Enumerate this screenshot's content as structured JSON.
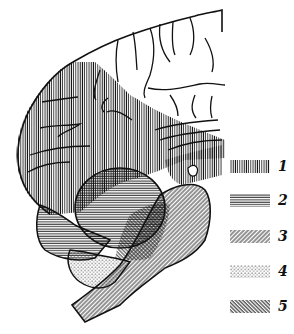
{
  "figure": {
    "type": "anatomical brain diagram (medial/lateral view) with hatched regions",
    "ink_color": "#111111",
    "background": "#ffffff"
  },
  "legend": {
    "items": [
      {
        "number": "1",
        "pattern": "vertical-lines"
      },
      {
        "number": "2",
        "pattern": "horizontal-lines"
      },
      {
        "number": "3",
        "pattern": "diagonal-lines-forward"
      },
      {
        "number": "4",
        "pattern": "dots"
      },
      {
        "number": "5",
        "pattern": "diagonal-lines-backward"
      }
    ]
  }
}
